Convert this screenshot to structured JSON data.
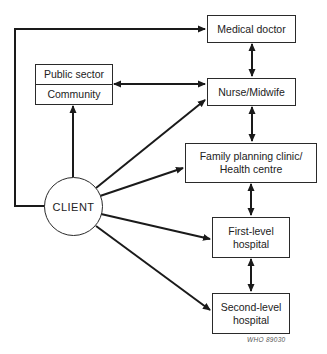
{
  "diagram": {
    "type": "referral-flow",
    "nodes": {
      "client": {
        "label": "CLIENT"
      },
      "medical_doctor": {
        "label": "Medical doctor"
      },
      "nurse_midwife": {
        "label": "Nurse/Midwife"
      },
      "public_sector": {
        "label": "Public sector"
      },
      "community": {
        "label": "Community"
      },
      "family_planning": {
        "line1": "Family planning clinic/",
        "line2": "Health centre"
      },
      "first_level": {
        "line1": "First-level",
        "line2": "hospital"
      },
      "second_level": {
        "line1": "Second-level",
        "line2": "hospital"
      }
    },
    "edges": [
      {
        "from": "CLIENT",
        "to": "Medical doctor",
        "direction": "one-way"
      },
      {
        "from": "CLIENT",
        "to": "Public sector / Community",
        "direction": "one-way"
      },
      {
        "from": "CLIENT",
        "to": "Nurse/Midwife",
        "direction": "one-way"
      },
      {
        "from": "CLIENT",
        "to": "Family planning clinic/Health centre",
        "direction": "one-way"
      },
      {
        "from": "CLIENT",
        "to": "First-level hospital",
        "direction": "one-way"
      },
      {
        "from": "CLIENT",
        "to": "Second-level hospital",
        "direction": "one-way"
      },
      {
        "from": "Public sector / Community",
        "to": "Nurse/Midwife",
        "direction": "two-way"
      },
      {
        "from": "Medical doctor",
        "to": "Nurse/Midwife",
        "direction": "two-way"
      },
      {
        "from": "Nurse/Midwife",
        "to": "Family planning clinic/Health centre",
        "direction": "two-way"
      },
      {
        "from": "Family planning clinic/Health centre",
        "to": "First-level hospital",
        "direction": "two-way"
      },
      {
        "from": "First-level hospital",
        "to": "Second-level hospital",
        "direction": "two-way"
      }
    ],
    "credit": "WHO  89030",
    "colors": {
      "line": "#1a1a1a",
      "background": "#ffffff"
    }
  }
}
